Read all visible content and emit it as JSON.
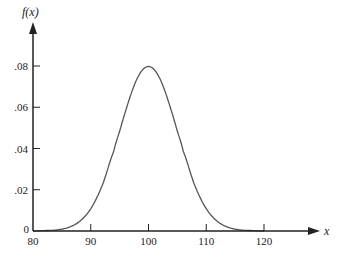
{
  "chart_data": {
    "type": "line",
    "title": "",
    "xlabel": "x",
    "ylabel": "f(x)",
    "xlim": [
      80,
      120
    ],
    "ylim": [
      0,
      0.08
    ],
    "grid": false,
    "legend": null,
    "x_ticks": [
      {
        "value": 80,
        "label": "80"
      },
      {
        "value": 90,
        "label": "90"
      },
      {
        "value": 100,
        "label": "100"
      },
      {
        "value": 110,
        "label": "110"
      },
      {
        "value": 120,
        "label": "120"
      }
    ],
    "y_ticks": [
      {
        "value": 0,
        "label": "0"
      },
      {
        "value": 0.02,
        "label": ".02"
      },
      {
        "value": 0.04,
        "label": ".04"
      },
      {
        "value": 0.06,
        "label": ".06"
      },
      {
        "value": 0.08,
        "label": ".08"
      }
    ],
    "series": [
      {
        "name": "f(x)",
        "description": "Bell-shaped density centered at 100, peak about .08",
        "x": [
          80,
          82,
          84,
          86,
          88,
          90,
          92,
          94,
          95,
          96,
          97,
          98,
          99,
          100,
          101,
          102,
          103,
          104,
          105,
          106,
          108,
          110,
          112,
          114,
          116,
          118,
          120
        ],
        "y": [
          0.0,
          0.0002,
          0.0005,
          0.0016,
          0.0045,
          0.0108,
          0.0222,
          0.0388,
          0.0484,
          0.0579,
          0.0666,
          0.0737,
          0.0782,
          0.0798,
          0.0782,
          0.0737,
          0.0666,
          0.0579,
          0.0484,
          0.0388,
          0.0222,
          0.0108,
          0.0045,
          0.0016,
          0.0005,
          0.0002,
          0.0
        ]
      }
    ],
    "colors": {
      "axis": "#222222",
      "curve": "#555555"
    }
  }
}
